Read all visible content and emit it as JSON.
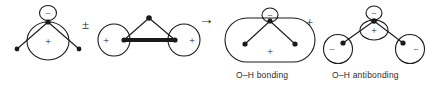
{
  "figure": {
    "kind": "molecular-orbital-combination-diagram",
    "background_color": "#ffffff",
    "stroke_color": "#1a1a1a",
    "width": 429,
    "height": 95
  },
  "operators": [
    {
      "name": "plus-minus",
      "symbol": "±",
      "x": 84,
      "y": 24
    },
    {
      "name": "right-arrow",
      "symbol": "→",
      "x": 201,
      "y": 18
    },
    {
      "name": "plus",
      "symbol": "+",
      "x": 309,
      "y": 22
    }
  ],
  "captions": [
    {
      "name": "bonding-caption",
      "text": "O–H bonding",
      "x": 236,
      "y": 71
    },
    {
      "name": "antibonding-caption",
      "text": "O–H antibonding",
      "x": 332,
      "y": 71
    }
  ],
  "structures": [
    {
      "name": "oxygen-p-orbital-lobes",
      "signs": [
        {
          "label": "−",
          "x": 48,
          "y": 13
        },
        {
          "label": "+",
          "x": 48,
          "y": 41
        }
      ],
      "atom_dots": [
        {
          "x": 48,
          "y": 22
        },
        {
          "x": 17,
          "y": 49
        },
        {
          "x": 79,
          "y": 49
        }
      ]
    },
    {
      "name": "hydrogen-1s-in-phase-pair",
      "signs": [
        {
          "label": "+",
          "x": 114,
          "y": 40
        },
        {
          "label": "+",
          "x": 184,
          "y": 40
        }
      ],
      "atom_dots": [
        {
          "x": 149,
          "y": 18
        },
        {
          "x": 124,
          "y": 40
        },
        {
          "x": 175,
          "y": 40
        }
      ]
    },
    {
      "name": "oh-bonding-orbital",
      "signs": [
        {
          "label": "−",
          "x": 270,
          "y": 15
        },
        {
          "label": "+",
          "x": 270,
          "y": 50
        }
      ],
      "atom_dots": [
        {
          "x": 270,
          "y": 23
        },
        {
          "x": 245,
          "y": 44
        },
        {
          "x": 295,
          "y": 44
        }
      ]
    },
    {
      "name": "oh-antibonding-orbital",
      "signs": [
        {
          "label": "−",
          "x": 374,
          "y": 13
        },
        {
          "label": "+",
          "x": 374,
          "y": 30
        },
        {
          "label": "−",
          "x": 338,
          "y": 49
        },
        {
          "label": "−",
          "x": 410,
          "y": 49
        }
      ],
      "atom_dots": [
        {
          "x": 374,
          "y": 21
        },
        {
          "x": 343,
          "y": 43
        },
        {
          "x": 403,
          "y": 43
        }
      ]
    }
  ]
}
